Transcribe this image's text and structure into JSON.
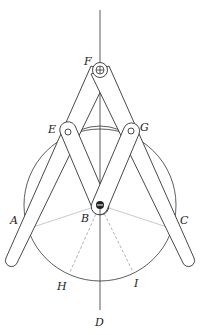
{
  "diagram": {
    "labels": {
      "A": "A",
      "B": "B",
      "C": "C",
      "D": "D",
      "E": "E",
      "F": "F",
      "G": "G",
      "H": "H",
      "I": "I"
    }
  }
}
